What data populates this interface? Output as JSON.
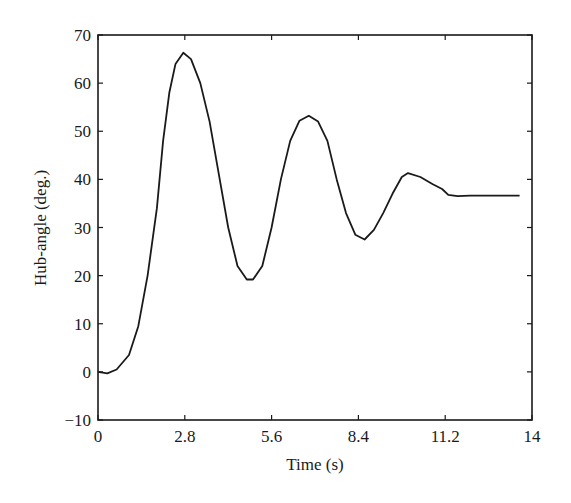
{
  "chart_data": {
    "type": "line",
    "title": "",
    "xlabel": "Time (s)",
    "ylabel": "Hub-angle (deg.)",
    "xlim": [
      0,
      14
    ],
    "ylim": [
      -10,
      70
    ],
    "x_ticks": [
      0,
      2.8,
      5.6,
      8.4,
      11.2,
      14
    ],
    "x_tick_labels": [
      "0",
      "2.8",
      "5.6",
      "8.4",
      "11.2",
      "14"
    ],
    "y_ticks": [
      -10,
      0,
      10,
      20,
      30,
      40,
      50,
      60,
      70
    ],
    "y_tick_labels": [
      "−10",
      "0",
      "10",
      "20",
      "30",
      "40",
      "50",
      "60",
      "70"
    ],
    "grid": false,
    "legend": null,
    "series": [
      {
        "name": "Hub-angle",
        "color": "#1a1a1a",
        "x": [
          0,
          0.3,
          0.6,
          1.0,
          1.3,
          1.6,
          1.9,
          2.1,
          2.3,
          2.5,
          2.75,
          3.0,
          3.3,
          3.6,
          3.9,
          4.2,
          4.5,
          4.8,
          5.0,
          5.3,
          5.6,
          5.9,
          6.2,
          6.5,
          6.8,
          7.1,
          7.4,
          7.7,
          8.0,
          8.3,
          8.6,
          8.9,
          9.2,
          9.5,
          9.8,
          10.0,
          10.4,
          10.8,
          11.1,
          11.3,
          11.6,
          12.0,
          13.6
        ],
        "values": [
          0,
          -0.3,
          0.5,
          3.5,
          9.5,
          20,
          34,
          48,
          58,
          64,
          66.3,
          65,
          60,
          52,
          41,
          30,
          22,
          19.2,
          19.2,
          22,
          30,
          40,
          48,
          52.2,
          53.2,
          52,
          48,
          40,
          33,
          28.5,
          27.5,
          29.5,
          33,
          37,
          40.5,
          41.3,
          40.5,
          39,
          38,
          36.8,
          36.5,
          36.6,
          36.6
        ]
      }
    ]
  }
}
